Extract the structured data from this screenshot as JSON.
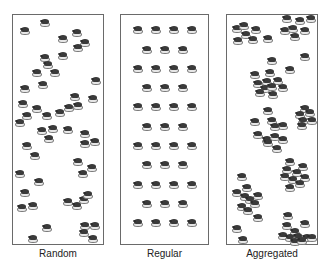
{
  "figure": {
    "panels": [
      {
        "id": "random",
        "label": "Random",
        "box": {
          "left": 12,
          "width": 92
        },
        "points": [
          [
            45,
            23
          ],
          [
            25,
            31
          ],
          [
            63,
            39
          ],
          [
            77,
            33
          ],
          [
            85,
            43
          ],
          [
            78,
            48
          ],
          [
            45,
            58
          ],
          [
            48,
            65
          ],
          [
            63,
            56
          ],
          [
            37,
            73
          ],
          [
            55,
            73
          ],
          [
            96,
            81
          ],
          [
            25,
            89
          ],
          [
            43,
            85
          ],
          [
            75,
            97
          ],
          [
            93,
            99
          ],
          [
            23,
            104
          ],
          [
            37,
            109
          ],
          [
            27,
            116
          ],
          [
            47,
            116
          ],
          [
            60,
            113
          ],
          [
            69,
            108
          ],
          [
            78,
            106
          ],
          [
            20,
            123
          ],
          [
            42,
            131
          ],
          [
            53,
            129
          ],
          [
            68,
            130
          ],
          [
            85,
            134
          ],
          [
            49,
            139
          ],
          [
            85,
            144
          ],
          [
            95,
            142
          ],
          [
            27,
            146
          ],
          [
            35,
            156
          ],
          [
            78,
            162
          ],
          [
            92,
            168
          ],
          [
            83,
            174
          ],
          [
            20,
            174
          ],
          [
            39,
            182
          ],
          [
            25,
            193
          ],
          [
            68,
            202
          ],
          [
            77,
            206
          ],
          [
            84,
            200
          ],
          [
            88,
            195
          ],
          [
            22,
            208
          ],
          [
            33,
            206
          ],
          [
            47,
            228
          ],
          [
            85,
            226
          ],
          [
            95,
            226
          ],
          [
            84,
            233
          ],
          [
            93,
            239
          ],
          [
            33,
            239
          ]
        ]
      },
      {
        "id": "regular",
        "label": "Regular",
        "box": {
          "left": 120,
          "width": 89
        },
        "rows": [
          30,
          50,
          69,
          88,
          107,
          127,
          146,
          165,
          185,
          204,
          223
        ],
        "cols_wide": [
          138,
          156,
          174,
          192
        ],
        "cols_narrow": [
          147,
          165,
          183
        ]
      },
      {
        "id": "aggregated",
        "label": "Aggregated",
        "box": {
          "left": 226,
          "width": 92
        },
        "points": [
          [
            237,
            29
          ],
          [
            244,
            26
          ],
          [
            256,
            30
          ],
          [
            246,
            35
          ],
          [
            238,
            41
          ],
          [
            253,
            40
          ],
          [
            268,
            39
          ],
          [
            287,
            19
          ],
          [
            300,
            21
          ],
          [
            311,
            19
          ],
          [
            285,
            31
          ],
          [
            293,
            29
          ],
          [
            305,
            31
          ],
          [
            295,
            37
          ],
          [
            272,
            61
          ],
          [
            305,
            57
          ],
          [
            290,
            70
          ],
          [
            255,
            75
          ],
          [
            270,
            73
          ],
          [
            278,
            81
          ],
          [
            258,
            84
          ],
          [
            267,
            82
          ],
          [
            265,
            89
          ],
          [
            272,
            87
          ],
          [
            283,
            88
          ],
          [
            260,
            93
          ],
          [
            273,
            95
          ],
          [
            268,
            111
          ],
          [
            305,
            109
          ],
          [
            300,
            115
          ],
          [
            310,
            113
          ],
          [
            303,
            121
          ],
          [
            312,
            121
          ],
          [
            255,
            122
          ],
          [
            272,
            121
          ],
          [
            283,
            126
          ],
          [
            275,
            127
          ],
          [
            302,
            126
          ],
          [
            258,
            135
          ],
          [
            267,
            140
          ],
          [
            275,
            137
          ],
          [
            283,
            140
          ],
          [
            268,
            143
          ],
          [
            277,
            149
          ],
          [
            290,
            162
          ],
          [
            303,
            167
          ],
          [
            287,
            170
          ],
          [
            297,
            173
          ],
          [
            285,
            177
          ],
          [
            305,
            178
          ],
          [
            293,
            180
          ],
          [
            300,
            184
          ],
          [
            290,
            188
          ],
          [
            242,
            177
          ],
          [
            247,
            188
          ],
          [
            237,
            193
          ],
          [
            245,
            197
          ],
          [
            258,
            196
          ],
          [
            250,
            200
          ],
          [
            255,
            204
          ],
          [
            242,
            207
          ],
          [
            248,
            211
          ],
          [
            258,
            218
          ],
          [
            237,
            229
          ],
          [
            243,
            240
          ],
          [
            288,
            216
          ],
          [
            287,
            226
          ],
          [
            305,
            224
          ],
          [
            295,
            232
          ],
          [
            283,
            236
          ],
          [
            290,
            238
          ],
          [
            298,
            237
          ],
          [
            307,
            238
          ],
          [
            295,
            242
          ],
          [
            302,
            241
          ],
          [
            312,
            238
          ]
        ]
      }
    ],
    "icon": "organism-icon"
  }
}
